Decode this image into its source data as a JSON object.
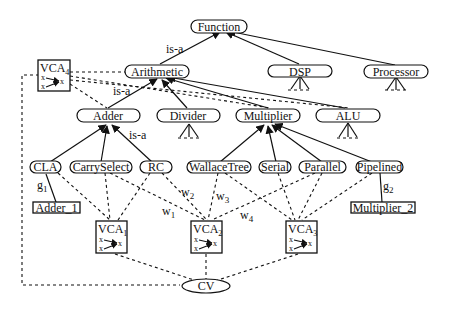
{
  "diagram": {
    "nodes": {
      "function": "Function",
      "arithmetic": "Arithmetic",
      "dsp": "DSP",
      "processor": "Processor",
      "adder": "Adder",
      "divider": "Divider",
      "multiplier": "Multiplier",
      "alu": "ALU",
      "cla": "CLA",
      "carryselect": "CarrySelect",
      "rc": "RC",
      "wallacetree": "WallaceTree",
      "serial": "Serial",
      "parallel": "Parallel",
      "pipelined": "Pipelined",
      "adder_1": "Adder_1",
      "multiplier_2": "Multiplier_2",
      "cv": "CV"
    },
    "vca": [
      {
        "id": "vca1",
        "base": "VCA",
        "sub": "1"
      },
      {
        "id": "vca2",
        "base": "VCA",
        "sub": "2"
      },
      {
        "id": "vca3",
        "base": "VCA",
        "sub": "3"
      },
      {
        "id": "vca4",
        "base": "VCA",
        "sub": "4"
      }
    ],
    "vca_symbol": {
      "input": "x",
      "output": "x"
    },
    "edge_labels": {
      "isa_function_arith": "is-a",
      "isa_arith_adder": "is-a",
      "isa_adder_rc": "is-a",
      "g1": {
        "base": "g",
        "sub": "1"
      },
      "g2": {
        "base": "g",
        "sub": "2"
      },
      "w1": {
        "base": "w",
        "sub": "1"
      },
      "w2": {
        "base": "w",
        "sub": "2"
      },
      "w3": {
        "base": "w",
        "sub": "3"
      },
      "w4": {
        "base": "w",
        "sub": "4"
      }
    },
    "hierarchy": [
      {
        "parent": "Function",
        "children": [
          "Arithmetic",
          "DSP",
          "Processor"
        ]
      },
      {
        "parent": "Arithmetic",
        "children": [
          "Adder",
          "Divider",
          "Multiplier",
          "ALU"
        ]
      },
      {
        "parent": "Adder",
        "children": [
          "CLA",
          "CarrySelect",
          "RC"
        ]
      },
      {
        "parent": "Multiplier",
        "children": [
          "WallaceTree",
          "Serial",
          "Parallel",
          "Pipelined"
        ]
      }
    ],
    "instances": [
      {
        "class": "CLA",
        "instance": "Adder_1",
        "label": "g1"
      },
      {
        "class": "Pipelined",
        "instance": "Multiplier_2",
        "label": "g2"
      }
    ],
    "vca_links": [
      {
        "vca": "VCA1",
        "inputs": [
          "CLA",
          "CarrySelect",
          "RC"
        ]
      },
      {
        "vca": "VCA2",
        "inputs": [
          "CarrySelect",
          "RC",
          "WallaceTree",
          "Parallel"
        ],
        "weights": [
          "w1",
          "w2",
          "w3",
          "w4"
        ]
      },
      {
        "vca": "VCA3",
        "inputs": [
          "WallaceTree",
          "Serial",
          "Parallel",
          "Pipelined"
        ]
      },
      {
        "vca": "VCA4",
        "inputs": [
          "Arithmetic",
          "Adder",
          "Multiplier",
          "ALU"
        ]
      }
    ],
    "cv_inputs": [
      "VCA1",
      "VCA2",
      "VCA3",
      "VCA4"
    ]
  }
}
